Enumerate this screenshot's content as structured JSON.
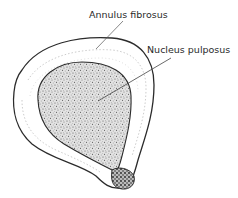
{
  "diagram": {
    "labels": [
      {
        "id": "annulus",
        "text": "Annulus fibrosus"
      },
      {
        "id": "nucleus",
        "text": "Nucleus pulposus"
      }
    ],
    "colors": {
      "outline": "#2b2b2b",
      "nucleus_fill": "#d8d8d8",
      "annulus_fill": "#ffffff",
      "leader_line": "#555555"
    }
  }
}
